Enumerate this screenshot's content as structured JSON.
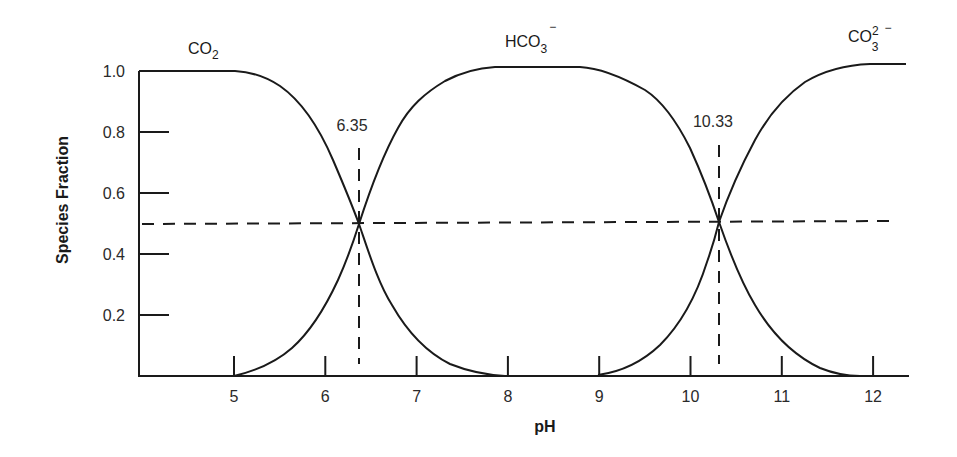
{
  "chart_data": {
    "type": "line",
    "title": "",
    "xlabel": "pH",
    "ylabel": "Species Fraction",
    "xlim": [
      4.0,
      12.4
    ],
    "ylim": [
      0.0,
      1.0
    ],
    "x_ticks": [
      5,
      6,
      7,
      8,
      9,
      10,
      11,
      12
    ],
    "x_tick_labels": [
      "5",
      "6",
      "7",
      "8",
      "9",
      "10",
      "11",
      "12"
    ],
    "y_ticks": [
      0.2,
      0.4,
      0.6,
      0.8,
      1.0
    ],
    "y_tick_labels": [
      "0.2",
      "0.4",
      "0.6",
      "0.8",
      "1.0"
    ],
    "grid": false,
    "legend": "none (species labeled directly above curves)",
    "series": [
      {
        "name": "CO2",
        "label_main": "CO",
        "label_sub": "2",
        "label_sup": "",
        "x": [
          4.0,
          5.0,
          5.5,
          6.0,
          6.35,
          6.7,
          7.0,
          7.5,
          8.0
        ],
        "values": [
          1.0,
          0.98,
          0.93,
          0.7,
          0.5,
          0.27,
          0.12,
          0.02,
          0.0
        ]
      },
      {
        "name": "HCO3-",
        "label_main": "HCO",
        "label_sub": "3",
        "label_sup": "−",
        "x": [
          5.0,
          5.5,
          6.0,
          6.35,
          6.7,
          7.0,
          7.5,
          8.0,
          9.0,
          9.5,
          10.0,
          10.33,
          10.7,
          11.0,
          11.5,
          12.0
        ],
        "values": [
          0.0,
          0.09,
          0.24,
          0.5,
          0.74,
          0.88,
          0.98,
          1.0,
          1.0,
          0.94,
          0.7,
          0.5,
          0.27,
          0.12,
          0.02,
          0.0
        ]
      },
      {
        "name": "CO3 2-",
        "label_main": "CO",
        "label_sub": "3",
        "label_sup": "2−",
        "x": [
          9.0,
          9.5,
          10.0,
          10.33,
          10.7,
          11.0,
          11.5,
          12.0,
          12.35
        ],
        "values": [
          0.0,
          0.06,
          0.26,
          0.5,
          0.71,
          0.86,
          0.97,
          1.0,
          1.0
        ]
      }
    ],
    "reference_lines": [
      {
        "orientation": "horizontal",
        "y": 0.5,
        "style": "dashed"
      },
      {
        "orientation": "vertical",
        "x": 6.35,
        "style": "dashed",
        "label": "6.35"
      },
      {
        "orientation": "vertical",
        "x": 10.33,
        "style": "dashed",
        "label": "10.33"
      }
    ],
    "annotations": [
      "6.35",
      "10.33"
    ]
  },
  "labels": {
    "pka1": "6.35",
    "pka2": "10.33",
    "xlabel": "pH",
    "ylabel": "Species Fraction",
    "co2_main": "CO",
    "co2_sub": "2",
    "hco3_main": "HCO",
    "hco3_sub": "3",
    "hco3_sup": "−",
    "co3_main": "CO",
    "co3_sub": "3",
    "co3_sup": "2",
    "co3_sup2": "−"
  }
}
